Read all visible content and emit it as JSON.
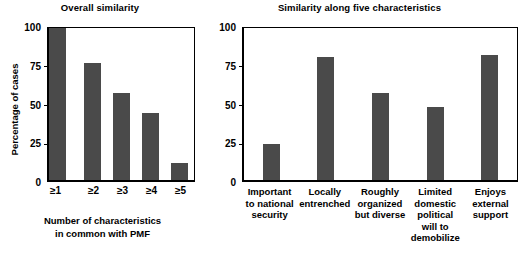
{
  "chart_data": [
    {
      "type": "bar",
      "title": "Overall similarity",
      "xlabel": "Number of characteristics in common with PMF",
      "ylabel": "Percentage of cases",
      "categories": [
        "≥1",
        "≥2",
        "≥3",
        "≥4",
        "≥5"
      ],
      "values": [
        100,
        77,
        57,
        44,
        11
      ],
      "ylim": [
        0,
        100
      ],
      "yticks": [
        "0",
        "25",
        "50",
        "75",
        "100"
      ],
      "grid": false,
      "legend": "none",
      "bar_color": "#4a4a4a"
    },
    {
      "type": "bar",
      "title": "Similarity along five characteristics",
      "xlabel": "",
      "ylabel": "",
      "categories": [
        "Important to national security",
        "Locally entrenched",
        "Roughly organized but diverse",
        "Limited domestic political will to demobilize",
        "Enjoys external support"
      ],
      "category_lines": [
        [
          "Important",
          "to national",
          "security"
        ],
        [
          "Locally",
          "entrenched"
        ],
        [
          "Roughly",
          "organized",
          "but diverse"
        ],
        [
          "Limited",
          "domestic",
          "political",
          "will to",
          "demobilize"
        ],
        [
          "Enjoys",
          "external",
          "support"
        ]
      ],
      "values": [
        24,
        81,
        57,
        48,
        82
      ],
      "ylim": [
        0,
        100
      ],
      "yticks": [
        "0",
        "25",
        "50",
        "75",
        "100"
      ],
      "grid": false,
      "legend": "none",
      "bar_color": "#4a4a4a"
    }
  ],
  "left": {
    "title": "Overall similarity",
    "ylabel": "Percentage of cases",
    "xtitle_line1": "Number of characteristics",
    "xtitle_line2": "in common with PMF",
    "yticks": {
      "t0": "0",
      "t25": "25",
      "t50": "50",
      "t75": "75",
      "t100": "100"
    },
    "xlabels": {
      "c0": "≥1",
      "c1": "≥2",
      "c2": "≥3",
      "c3": "≥4",
      "c4": "≥5"
    }
  },
  "right": {
    "title": "Similarity along five characteristics",
    "yticks": {
      "t0": "0",
      "t25": "25",
      "t50": "50",
      "t75": "75",
      "t100": "100"
    },
    "xlabels": {
      "c0": {
        "l1": "Important",
        "l2": "to national",
        "l3": "security"
      },
      "c1": {
        "l1": "Locally",
        "l2": "entrenched"
      },
      "c2": {
        "l1": "Roughly",
        "l2": "organized",
        "l3": "but diverse"
      },
      "c3": {
        "l1": "Limited",
        "l2": "domestic",
        "l3": "political",
        "l4": "will to",
        "l5": "demobilize"
      },
      "c4": {
        "l1": "Enjoys",
        "l2": "external",
        "l3": "support"
      }
    }
  }
}
